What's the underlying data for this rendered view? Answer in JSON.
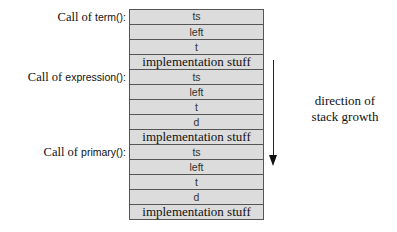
{
  "frames": [
    {
      "label_prefix": "Call of ",
      "function": "term():",
      "label_top": 10,
      "cells": [
        {
          "text": "ts",
          "kind": "var"
        },
        {
          "text": "left",
          "kind": "var"
        },
        {
          "text": "t",
          "kind": "var"
        },
        {
          "text": "implementation stuff",
          "kind": "impl"
        }
      ]
    },
    {
      "label_prefix": "Call of ",
      "function": "expression():",
      "label_top": 70,
      "cells": [
        {
          "text": "ts",
          "kind": "var"
        },
        {
          "text": "left",
          "kind": "var"
        },
        {
          "text": "t",
          "kind": "var"
        },
        {
          "text": "d",
          "kind": "var"
        },
        {
          "text": "implementation stuff",
          "kind": "impl"
        }
      ]
    },
    {
      "label_prefix": "Call of ",
      "function": "primary():",
      "label_top": 145,
      "cells": [
        {
          "text": "ts",
          "kind": "var"
        },
        {
          "text": "left",
          "kind": "var"
        },
        {
          "text": "t",
          "kind": "var"
        },
        {
          "text": "d",
          "kind": "var"
        },
        {
          "text": "implementation stuff",
          "kind": "impl"
        }
      ]
    }
  ],
  "growth": {
    "line1": "direction of",
    "line2": "stack growth"
  },
  "colors": {
    "cell_fill": "#dcdcdc",
    "border": "#555555",
    "text": "#111111"
  }
}
